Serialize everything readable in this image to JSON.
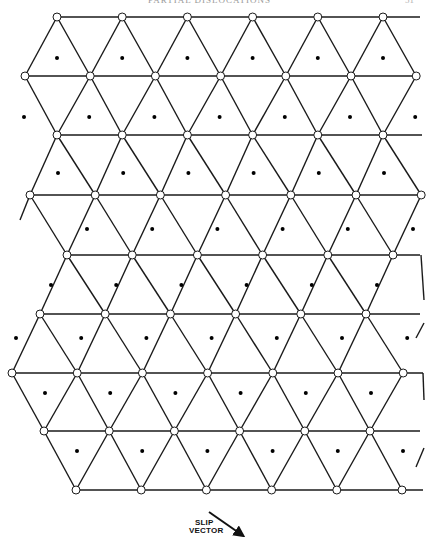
{
  "header": {
    "running_title": "PARTIAL DISLOCATIONS",
    "page_number": "51"
  },
  "figure": {
    "line_color": "#1a1a1a",
    "node_fill": "#ffffff",
    "dot_color": "#000000",
    "node_radius": 4,
    "spacing": 65.2,
    "rows": [
      {
        "y": 17,
        "x0": 57,
        "count": 6,
        "line_start": 57,
        "line_end": 420
      },
      {
        "y": 76,
        "x0": 25,
        "count": 7,
        "line_start": 25,
        "line_end": 417
      },
      {
        "y": 135,
        "x0": 57,
        "count": 6,
        "line_start": 57,
        "line_end": 422
      },
      {
        "y": 195,
        "x0": 30,
        "count": 7,
        "line_start": 30,
        "line_end": 421
      },
      {
        "y": 255,
        "x0": 67,
        "count": 6,
        "line_start": 67,
        "line_end": 420
      },
      {
        "y": 314,
        "x0": 40,
        "count": 6,
        "line_start": 40,
        "line_end": 420
      },
      {
        "y": 373,
        "x0": 12,
        "count": 7,
        "line_start": 12,
        "line_end": 423
      },
      {
        "y": 431,
        "x0": 44,
        "count": 6,
        "line_start": 44,
        "line_end": 420
      },
      {
        "y": 490,
        "x0": 76,
        "count": 6,
        "line_start": 76,
        "line_end": 423
      }
    ],
    "dot_rows": [
      {
        "y": 58,
        "x0": 57,
        "count": 6
      },
      {
        "y": 117,
        "x0": 24,
        "count": 7
      },
      {
        "y": 173,
        "x0": 58,
        "count": 6
      },
      {
        "y": 229,
        "x0": 87,
        "count": 6
      },
      {
        "y": 285,
        "x0": 51,
        "count": 6
      },
      {
        "y": 338,
        "x0": 16,
        "count": 7
      },
      {
        "y": 393,
        "x0": 45,
        "count": 6
      },
      {
        "y": 451,
        "x0": 77,
        "count": 6
      }
    ],
    "edge_stubs": [
      {
        "x1": 30,
        "y1": 195,
        "x2": 20,
        "y2": 220
      },
      {
        "x1": 421,
        "y1": 255,
        "x2": 424,
        "y2": 300
      },
      {
        "x1": 423,
        "y1": 373,
        "x2": 424,
        "y2": 400
      },
      {
        "x1": 424,
        "y1": 448,
        "x2": 416,
        "y2": 467
      },
      {
        "x1": 424,
        "y1": 323,
        "x2": 416,
        "y2": 338
      }
    ]
  },
  "legend": {
    "label_line1": "SLIP",
    "label_line2": "VECTOR",
    "arrow": {
      "x1": 29,
      "y1": 4,
      "x2": 62,
      "y2": 27
    }
  }
}
